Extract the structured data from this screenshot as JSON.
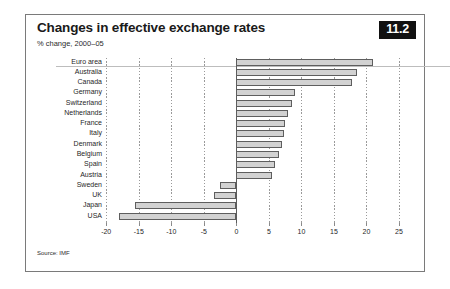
{
  "card": {
    "badge": "11.2",
    "source": "Source: IMF"
  },
  "chart_data": {
    "type": "bar",
    "orientation": "horizontal",
    "title": "Changes in effective exchange rates",
    "subtitle": "% change, 2000–05",
    "xlabel": "",
    "ylabel": "",
    "xlim": [
      -20,
      25
    ],
    "xticks": [
      -20,
      -15,
      -10,
      -5,
      0,
      5,
      10,
      15,
      20,
      25
    ],
    "xticklabels": [
      "-20",
      "-15",
      "-10",
      "-5",
      "0",
      "5",
      "10",
      "15",
      "20",
      "25"
    ],
    "grid": "vertical-dotted",
    "legend": "none",
    "bar_fill": "#d2d2d2",
    "bar_edge": "#5e5e5e",
    "categories": [
      "Euro area",
      "Australia",
      "Canada",
      "Germany",
      "Switzerland",
      "Netherlands",
      "France",
      "Italy",
      "Denmark",
      "Belgium",
      "Spain",
      "Austria",
      "Sweden",
      "UK",
      "Japan",
      "USA"
    ],
    "values": [
      21.0,
      18.5,
      17.8,
      9.0,
      8.5,
      8.0,
      7.5,
      7.3,
      7.0,
      6.5,
      6.0,
      5.5,
      -2.5,
      -3.5,
      -15.6,
      -18.1
    ]
  }
}
